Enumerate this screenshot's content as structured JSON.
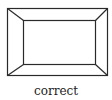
{
  "diagram": {
    "caption": "correct",
    "line_color": "#2a2a2a"
  }
}
